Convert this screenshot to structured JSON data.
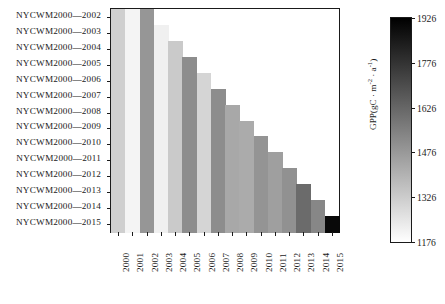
{
  "chart_data": {
    "type": "heatmap",
    "title": "",
    "xlabel": "",
    "ylabel": "",
    "cbar_label": "GPP(gC · m⁻² · a⁻¹)",
    "cbar_label_parts": {
      "prefix": "GPP(gC · m",
      "sup1": "-2",
      "mid": " · a",
      "sup2": "-1",
      "suffix": ")"
    },
    "cbar_ticks": [
      1176,
      1326,
      1476,
      1626,
      1776,
      1926
    ],
    "cbar_min": 1176,
    "cbar_max": 1926,
    "cbar_colormap": "grayscale_reversed",
    "grid": false,
    "legend_position": "right-colorbar",
    "x_categories": [
      "2000",
      "2001",
      "2002",
      "2003",
      "2004",
      "2005",
      "2006",
      "2007",
      "2008",
      "2009",
      "2010",
      "2011",
      "2012",
      "2013",
      "2014",
      "2015"
    ],
    "y_categories": [
      "NYCWM2000—2002",
      "NYCWM2000—2003",
      "NYCWM2000—2004",
      "NYCWM2000—2005",
      "NYCWM2000—2006",
      "NYCWM2000—2007",
      "NYCWM2000—2008",
      "NYCWM2000—2009",
      "NYCWM2000—2010",
      "NYCWM2000—2011",
      "NYCWM2000—2012",
      "NYCWM2000—2013",
      "NYCWM2000—2014",
      "NYCWM2000—2015"
    ],
    "annual_values": {
      "2000": 1318,
      "2001": 1208,
      "2002": 1486,
      "2003": 1220,
      "2004": 1332,
      "2005": 1512,
      "2006": 1300,
      "2007": 1512,
      "2008": 1432,
      "2009": 1424,
      "2010": 1492,
      "2011": 1458,
      "2012": 1500,
      "2013": 1610,
      "2014": 1530,
      "2015": 1900
    },
    "rows": [
      {
        "label": "NYCWM2000—2002",
        "values": [
          1318,
          1208,
          1486
        ]
      },
      {
        "label": "NYCWM2000—2003",
        "values": [
          1318,
          1208,
          1486,
          1220
        ]
      },
      {
        "label": "NYCWM2000—2004",
        "values": [
          1318,
          1208,
          1486,
          1220,
          1332
        ]
      },
      {
        "label": "NYCWM2000—2005",
        "values": [
          1318,
          1208,
          1486,
          1220,
          1332,
          1512
        ]
      },
      {
        "label": "NYCWM2000—2006",
        "values": [
          1318,
          1208,
          1486,
          1220,
          1332,
          1512,
          1300
        ]
      },
      {
        "label": "NYCWM2000—2007",
        "values": [
          1318,
          1208,
          1486,
          1220,
          1332,
          1512,
          1300,
          1512
        ]
      },
      {
        "label": "NYCWM2000—2008",
        "values": [
          1318,
          1208,
          1486,
          1220,
          1332,
          1512,
          1300,
          1512,
          1432
        ]
      },
      {
        "label": "NYCWM2000—2009",
        "values": [
          1318,
          1208,
          1486,
          1220,
          1332,
          1512,
          1300,
          1512,
          1432,
          1424
        ]
      },
      {
        "label": "NYCWM2000—2010",
        "values": [
          1318,
          1208,
          1486,
          1220,
          1332,
          1512,
          1300,
          1512,
          1432,
          1424,
          1492
        ]
      },
      {
        "label": "NYCWM2000—2011",
        "values": [
          1318,
          1208,
          1486,
          1220,
          1332,
          1512,
          1300,
          1512,
          1432,
          1424,
          1492,
          1458
        ]
      },
      {
        "label": "NYCWM2000—2012",
        "values": [
          1318,
          1208,
          1486,
          1220,
          1332,
          1512,
          1300,
          1512,
          1432,
          1424,
          1492,
          1458,
          1500
        ]
      },
      {
        "label": "NYCWM2000—2013",
        "values": [
          1318,
          1208,
          1486,
          1220,
          1332,
          1512,
          1300,
          1512,
          1432,
          1424,
          1492,
          1458,
          1500,
          1610
        ]
      },
      {
        "label": "NYCWM2000—2014",
        "values": [
          1318,
          1208,
          1486,
          1220,
          1332,
          1512,
          1300,
          1512,
          1432,
          1424,
          1492,
          1458,
          1500,
          1610,
          1530
        ]
      },
      {
        "label": "NYCWM2000—2015",
        "values": [
          1318,
          1208,
          1486,
          1220,
          1332,
          1512,
          1300,
          1512,
          1432,
          1424,
          1492,
          1458,
          1500,
          1610,
          1530,
          1900
        ]
      }
    ]
  },
  "colors": {
    "axis": "#1a1a1a",
    "text": "#1a1a1a",
    "background": "#ffffff",
    "cbar_low": "#ffffff",
    "cbar_high": "#000000"
  }
}
